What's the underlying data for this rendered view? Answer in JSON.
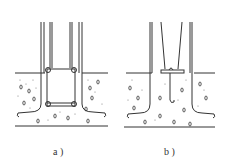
{
  "figure": {
    "type": "engineering-section-diagram",
    "panels": [
      {
        "id": "a",
        "label": "a )",
        "description": "column base with rectangular tied rebar cage embedded in concrete foundation, hooked bottom bars"
      },
      {
        "id": "b",
        "label": "b )",
        "description": "column base with tapered bars and bolted plate, hooked bars embedded in concrete foundation"
      }
    ],
    "colors": {
      "line": "#333333",
      "background": "#ffffff"
    }
  }
}
